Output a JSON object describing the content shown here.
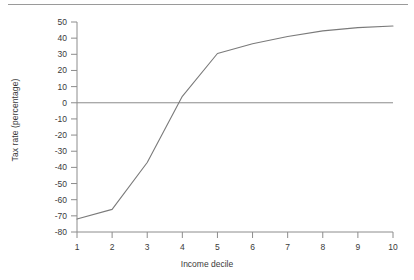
{
  "chart_data": {
    "type": "line",
    "title": "",
    "xlabel": "Income decile",
    "ylabel": "Tax rate (percentage)",
    "x": [
      1,
      2,
      3,
      4,
      5,
      6,
      7,
      8,
      9,
      10
    ],
    "values": [
      -72,
      -66,
      -37,
      4,
      30.5,
      36.5,
      41,
      44.5,
      46.5,
      47.5
    ],
    "series": [
      {
        "name": "Tax rate",
        "values": [
          -72,
          -66,
          -37,
          4,
          30.5,
          36.5,
          41,
          44.5,
          46.5,
          47.5
        ]
      }
    ],
    "xticklabels": [
      "1",
      "2",
      "3",
      "4",
      "5",
      "6",
      "7",
      "8",
      "9",
      "10"
    ],
    "yticklabels": [
      "50",
      "40",
      "30",
      "20",
      "10",
      "0",
      "-10",
      "-20",
      "-30",
      "-40",
      "-50",
      "-60",
      "-70",
      "-80"
    ],
    "yticks": [
      50,
      40,
      30,
      20,
      10,
      0,
      -10,
      -20,
      -30,
      -40,
      -50,
      -60,
      -70,
      -80
    ],
    "xlim": [
      1,
      10
    ],
    "ylim": [
      -80,
      50
    ],
    "grid": false,
    "legend": false,
    "zero_line": true,
    "line_color": "#7a7a7a",
    "axis_color": "#8c8c8c",
    "text_color": "#3a3a3a",
    "background": "#ffffff"
  }
}
